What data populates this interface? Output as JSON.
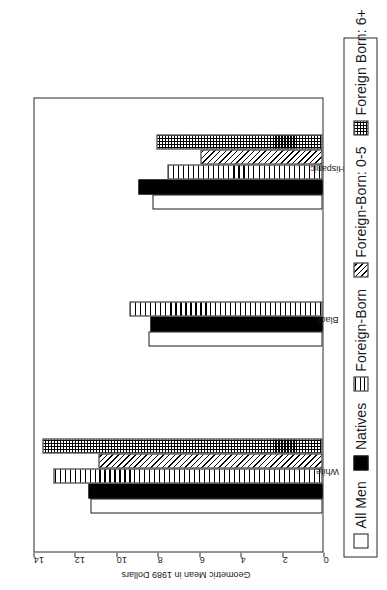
{
  "chart_data": {
    "type": "bar",
    "orientation": "horizontal-printed-rotated",
    "title": "",
    "xlabel": "",
    "ylabel": "Geometric Mean in 1989 Dollars",
    "categories": [
      "White",
      "Black",
      "Hispanic"
    ],
    "ylim": [
      0,
      14
    ],
    "yticks": [
      0,
      2,
      4,
      6,
      8,
      10,
      12,
      14
    ],
    "ytick_labels": [
      "0",
      "2",
      "4",
      "6",
      "8",
      "10",
      "12",
      "14"
    ],
    "grid": false,
    "legend_position": "bottom",
    "series": [
      {
        "name": "All Men",
        "pattern": "empty",
        "values": [
          11.2,
          8.4,
          8.2
        ]
      },
      {
        "name": "Natives",
        "pattern": "solid",
        "values": [
          11.3,
          8.3,
          8.9
        ]
      },
      {
        "name": "Foreign-Born",
        "pattern": "horizontal-lines",
        "values": [
          13.0,
          9.3,
          7.5
        ]
      },
      {
        "name": "Foreign-Born: 0-5",
        "pattern": "diagonal-hatch",
        "values": [
          10.8,
          null,
          5.9
        ]
      },
      {
        "name": "Foreign Born: 6+",
        "pattern": "dots",
        "values": [
          13.5,
          null,
          8.0
        ]
      }
    ]
  },
  "axis": {
    "value_axis_title": "Geometric Mean in 1989 Dollars",
    "tick_labels": [
      "14",
      "12",
      "10",
      "8",
      "6",
      "4",
      "2",
      "0"
    ],
    "category_labels": [
      "Hispanic",
      "Black",
      "White"
    ]
  },
  "legend": {
    "items": [
      {
        "label": "All Men",
        "pattern": "empty"
      },
      {
        "label": "Natives",
        "pattern": "solid"
      },
      {
        "label": "Foreign-Born",
        "pattern": "horizontal-lines"
      },
      {
        "label": "Foreign-Born: 0-5",
        "pattern": "diagonal-hatch"
      },
      {
        "label": "Foreign Born: 6+",
        "pattern": "dots"
      }
    ]
  },
  "colors": {
    "ink": "#000000",
    "axis": "#2b2b2b",
    "background": "#ffffff"
  }
}
